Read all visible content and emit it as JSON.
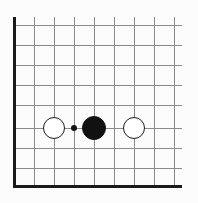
{
  "figure": {
    "width": 198,
    "height": 203,
    "background_color": "#fcfcfc"
  },
  "board": {
    "type": "go-board-corner",
    "corner": "bottom-left",
    "grid_color": "#8a8a8a",
    "edge_color": "#1a1a1a",
    "edge_thickness": 3,
    "grid_thickness": 1,
    "cell_size": 20,
    "origin_x": 14,
    "origin_y": 185,
    "columns": 9,
    "rows": 9,
    "vertical_lines_x": [
      14,
      34,
      54,
      74,
      94,
      114,
      134,
      154,
      174
    ],
    "horizontal_lines_y": [
      25,
      45,
      65,
      85,
      105,
      128,
      148,
      168,
      185
    ],
    "left_edge_is_thick": true,
    "bottom_edge_is_thick": true,
    "top_edge_is_open": true,
    "right_edge_is_open": true
  },
  "stones": [
    {
      "id": "white-stone-left",
      "color": "white",
      "fill": "#ffffff",
      "outline": "#1a1a1a",
      "cx": 54,
      "cy": 128,
      "radius": 11,
      "column": 2,
      "row": 6
    },
    {
      "id": "black-stone-center",
      "color": "black",
      "fill": "#111111",
      "outline": "#111111",
      "cx": 94,
      "cy": 128,
      "radius": 12,
      "column": 4,
      "row": 6
    },
    {
      "id": "white-stone-right",
      "color": "white",
      "fill": "#ffffff",
      "outline": "#1a1a1a",
      "cx": 134,
      "cy": 128,
      "radius": 11,
      "column": 6,
      "row": 6
    }
  ],
  "markers": [
    {
      "id": "point-marker-dot",
      "shape": "dot",
      "fill": "#111111",
      "cx": 74,
      "cy": 128,
      "radius": 3.2,
      "column": 3,
      "row": 6
    }
  ]
}
